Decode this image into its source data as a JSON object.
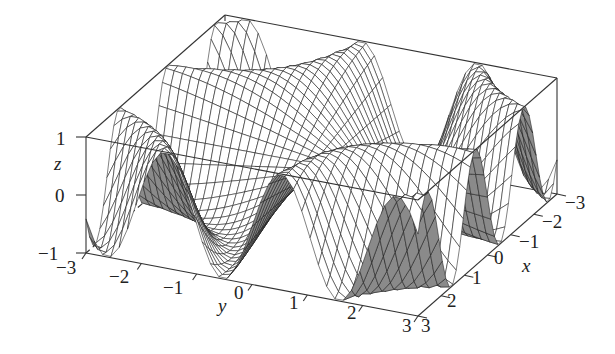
{
  "chart_data": {
    "type": "surface3d",
    "title": "",
    "function": "z = sin(x*y)",
    "xlabel": "x",
    "ylabel": "y",
    "zlabel": "z",
    "xlim": [
      -3,
      3
    ],
    "ylim": [
      -3,
      3
    ],
    "zlim": [
      -1,
      1
    ],
    "x_ticks": [
      -3,
      -2,
      -1,
      0,
      1,
      2,
      3
    ],
    "y_ticks": [
      -3,
      -2,
      -1,
      0,
      1,
      2,
      3
    ],
    "z_ticks": [
      -1,
      0,
      1
    ],
    "grid_resolution": 41,
    "mesh_color": "#1a1a1a",
    "face_color_front": "#ffffff",
    "face_color_back": "#8a8a8a",
    "box": true,
    "legend": null
  },
  "labels": {
    "z_axis": "z",
    "y_axis": "y",
    "x_axis": "x",
    "z_ticks": [
      "1",
      "0",
      "−1"
    ],
    "y_ticks": [
      "−3",
      "−2",
      "−1",
      "0",
      "1",
      "2",
      "3"
    ],
    "x_ticks": [
      "−3",
      "−2",
      "−1",
      "0",
      "1",
      "2",
      "3"
    ]
  }
}
